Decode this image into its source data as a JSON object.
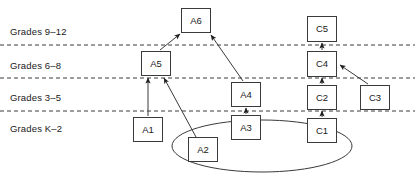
{
  "diagram": {
    "type": "learning-progression-map",
    "canvas": {
      "width": 415,
      "height": 176,
      "background": "#ffffff"
    },
    "grade_bands": [
      {
        "id": "band-9-12",
        "label": "Grades 9–12",
        "x": 10,
        "y": 27
      },
      {
        "id": "band-6-8",
        "label": "Grades 6–8",
        "x": 10,
        "y": 61
      },
      {
        "id": "band-3-5",
        "label": "Grades 3–5",
        "x": 10,
        "y": 93
      },
      {
        "id": "band-K-2",
        "label": "Grades K–2",
        "x": 10,
        "y": 124
      }
    ],
    "band_dividers": [
      {
        "id": "divider-9-12_6-8",
        "y": 45
      },
      {
        "id": "divider-6-8_3-5",
        "y": 78
      },
      {
        "id": "divider-3-5_K-2",
        "y": 111
      }
    ],
    "nodes": [
      {
        "id": "A6",
        "label": "A6",
        "x": 181,
        "y": 8,
        "w": 30,
        "h": 25
      },
      {
        "id": "A5",
        "label": "A5",
        "x": 141,
        "y": 51,
        "w": 30,
        "h": 25
      },
      {
        "id": "A4",
        "label": "A4",
        "x": 231,
        "y": 82,
        "w": 30,
        "h": 25
      },
      {
        "id": "A3",
        "label": "A3",
        "x": 231,
        "y": 115,
        "w": 30,
        "h": 25
      },
      {
        "id": "A1",
        "label": "A1",
        "x": 133,
        "y": 117,
        "w": 30,
        "h": 25
      },
      {
        "id": "A2",
        "label": "A2",
        "x": 188,
        "y": 137,
        "w": 30,
        "h": 25
      },
      {
        "id": "C5",
        "label": "C5",
        "x": 307,
        "y": 16,
        "w": 30,
        "h": 26
      },
      {
        "id": "C4",
        "label": "C4",
        "x": 307,
        "y": 51,
        "w": 30,
        "h": 26
      },
      {
        "id": "C2",
        "label": "C2",
        "x": 307,
        "y": 85,
        "w": 30,
        "h": 25
      },
      {
        "id": "C1",
        "label": "C1",
        "x": 307,
        "y": 118,
        "w": 30,
        "h": 25
      },
      {
        "id": "C3",
        "label": "C3",
        "x": 360,
        "y": 85,
        "w": 30,
        "h": 25
      }
    ],
    "edges": [
      {
        "id": "edge-A5-A6",
        "from": "A5",
        "to": "A6",
        "x1": 160,
        "y1": 50,
        "x2": 180,
        "y2": 34
      },
      {
        "id": "edge-A4-A6",
        "from": "A4",
        "to": "A6",
        "x1": 243,
        "y1": 81,
        "x2": 211,
        "y2": 35
      },
      {
        "id": "edge-A1-A5",
        "from": "A1",
        "to": "A5",
        "x1": 148,
        "y1": 116,
        "x2": 148,
        "y2": 78
      },
      {
        "id": "edge-A2-A5",
        "from": "A2",
        "to": "A5",
        "x1": 196,
        "y1": 137,
        "x2": 164,
        "y2": 78
      },
      {
        "id": "edge-A3-A4",
        "from": "A3",
        "to": "A4",
        "x1": 246,
        "y1": 114,
        "x2": 246,
        "y2": 108
      },
      {
        "id": "edge-C4-C5",
        "from": "C4",
        "to": "C5",
        "x1": 322,
        "y1": 50,
        "x2": 322,
        "y2": 43
      },
      {
        "id": "edge-C2-C4",
        "from": "C2",
        "to": "C4",
        "x1": 322,
        "y1": 84,
        "x2": 322,
        "y2": 78
      },
      {
        "id": "edge-C1-C2",
        "from": "C1",
        "to": "C2",
        "x1": 322,
        "y1": 117,
        "x2": 322,
        "y2": 111
      },
      {
        "id": "edge-C3-C4",
        "from": "C3",
        "to": "C4",
        "x1": 368,
        "y1": 84,
        "x2": 340,
        "y2": 65
      }
    ],
    "grouping_ellipse": {
      "id": "cluster-ellipse",
      "cx": 262,
      "cy": 146,
      "rx": 90,
      "ry": 26,
      "members": [
        "A2",
        "A3",
        "C1"
      ]
    },
    "style": {
      "line_color": "#3a3a3a",
      "divider_color": "#3a3a3a",
      "box_fill": "#ffffff",
      "text_color": "#1a1a1a"
    }
  }
}
